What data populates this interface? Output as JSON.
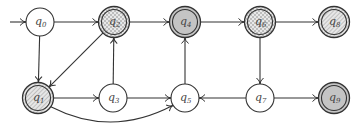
{
  "diagram": {
    "type": "finite-automaton",
    "colors": {
      "stroke": "#333333",
      "filled": "#c4c4c4",
      "hatch": "#9a9a9a",
      "checker": "#bdbdbd",
      "background": "#ffffff"
    },
    "start_state": "q0",
    "states": [
      {
        "id": "q0",
        "base": "q",
        "sub": "0",
        "x": 40,
        "y": 22,
        "accepting": false,
        "fill": "none"
      },
      {
        "id": "q1",
        "base": "q",
        "sub": "1",
        "x": 38,
        "y": 98,
        "accepting": true,
        "fill": "hatch"
      },
      {
        "id": "q2",
        "base": "q",
        "sub": "2",
        "x": 114,
        "y": 22,
        "accepting": true,
        "fill": "checker"
      },
      {
        "id": "q3",
        "base": "q",
        "sub": "3",
        "x": 113,
        "y": 98,
        "accepting": false,
        "fill": "none"
      },
      {
        "id": "q4",
        "base": "q",
        "sub": "4",
        "x": 185,
        "y": 22,
        "accepting": true,
        "fill": "solid"
      },
      {
        "id": "q5",
        "base": "q",
        "sub": "5",
        "x": 185,
        "y": 98,
        "accepting": false,
        "fill": "none"
      },
      {
        "id": "q6",
        "base": "q",
        "sub": "6",
        "x": 260,
        "y": 22,
        "accepting": true,
        "fill": "checker"
      },
      {
        "id": "q7",
        "base": "q",
        "sub": "7",
        "x": 260,
        "y": 98,
        "accepting": false,
        "fill": "none"
      },
      {
        "id": "q8",
        "base": "q",
        "sub": "8",
        "x": 334,
        "y": 22,
        "accepting": true,
        "fill": "hatch"
      },
      {
        "id": "q9",
        "base": "q",
        "sub": "9",
        "x": 334,
        "y": 98,
        "accepting": true,
        "fill": "solid"
      }
    ],
    "transitions": [
      {
        "from": "q0",
        "to": "q2"
      },
      {
        "from": "q0",
        "to": "q1"
      },
      {
        "from": "q2",
        "to": "q4"
      },
      {
        "from": "q2",
        "to": "q1"
      },
      {
        "from": "q3",
        "to": "q2"
      },
      {
        "from": "q1",
        "to": "q3"
      },
      {
        "from": "q1",
        "to": "q5",
        "curved": true
      },
      {
        "from": "q3",
        "to": "q5"
      },
      {
        "from": "q5",
        "to": "q4"
      },
      {
        "from": "q4",
        "to": "q6"
      },
      {
        "from": "q6",
        "to": "q8"
      },
      {
        "from": "q6",
        "to": "q7"
      },
      {
        "from": "q7",
        "to": "q5"
      },
      {
        "from": "q7",
        "to": "q9"
      }
    ]
  }
}
